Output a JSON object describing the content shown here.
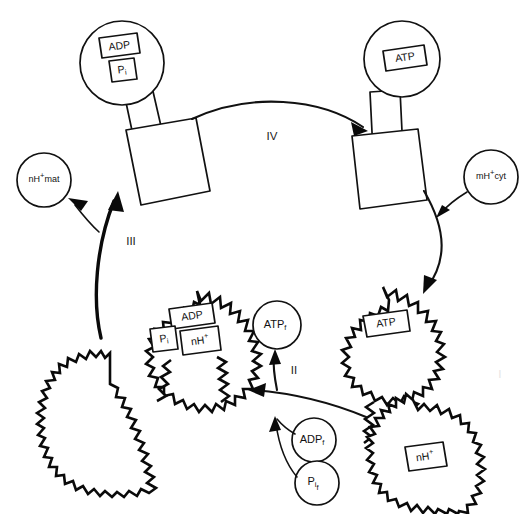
{
  "diagram": {
    "background_color": "#ffffff",
    "line_color": "#111111",
    "steps": [
      {
        "id": "step-1",
        "label": "I"
      },
      {
        "id": "step-2",
        "label": "II"
      },
      {
        "id": "step-3",
        "label": "III"
      },
      {
        "id": "step-4",
        "label": "IV"
      }
    ],
    "ion_pools": [
      {
        "id": "nh-mat",
        "prefix": "nH",
        "charge": "+",
        "suffix": "mat",
        "full": "nH+mat"
      },
      {
        "id": "mh-cyt",
        "prefix": "mH",
        "charge": "+",
        "suffix": "cyt",
        "full": "mH+cyt"
      }
    ],
    "free_metabolites": [
      {
        "id": "atp-free",
        "base": "ATP",
        "sub": "f",
        "full": "ATPf"
      },
      {
        "id": "adp-free",
        "base": "ADP",
        "sub": "f",
        "full": "ADPf"
      },
      {
        "id": "pi-free",
        "base": "P",
        "sub": "i",
        "sub2": "f",
        "full": "Pif"
      }
    ],
    "complexes": [
      {
        "id": "enzyme-top-left",
        "kind": "smooth",
        "head_shape": "circle",
        "stalk": true,
        "base_shape": "square",
        "bound_ligands": [
          "ADP",
          "Pi"
        ]
      },
      {
        "id": "enzyme-top-right",
        "kind": "smooth",
        "head_shape": "circle",
        "stalk": true,
        "base_shape": "square",
        "bound_ligands": [
          "ATP"
        ]
      },
      {
        "id": "enzyme-bottom-left",
        "kind": "spiky",
        "head_shape": "circle",
        "base_shape": "square",
        "bound_ligands": [
          "ADP",
          "Pi",
          "nH+"
        ]
      },
      {
        "id": "enzyme-bottom-right",
        "kind": "spiky",
        "head_shape": "circle",
        "base_shape": "square",
        "bound_ligands": [
          "ATP",
          "nH+"
        ]
      }
    ],
    "ligand_labels": {
      "adp": "ADP",
      "atp": "ATP",
      "pi_base": "P",
      "pi_sub": "i",
      "nh_base": "nH",
      "nh_sup": "+"
    }
  }
}
